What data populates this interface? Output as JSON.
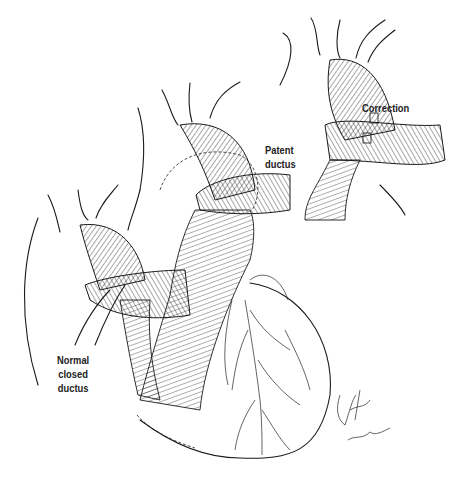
{
  "figure": {
    "panels": [
      {
        "id": "normal",
        "label": "Normal closed ductus"
      },
      {
        "id": "patent",
        "label": "Patent ductus"
      },
      {
        "id": "correction",
        "label": "Correction"
      }
    ],
    "labels": {
      "normal_line1": "Normal",
      "normal_line2": "closed",
      "normal_line3": "ductus",
      "patent_line1": "Patent",
      "patent_line2": "ductus",
      "correction": "Correction"
    },
    "signature": "artist signature"
  }
}
